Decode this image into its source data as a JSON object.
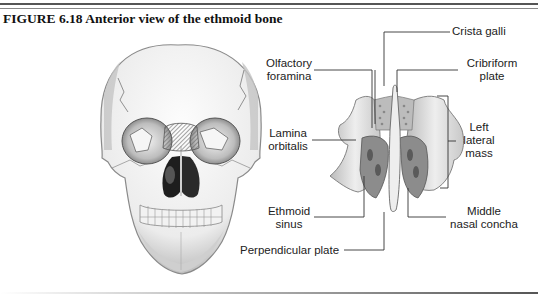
{
  "figure": {
    "title": "FIGURE 6.18  Anterior view of the ethmoid bone"
  },
  "labels": {
    "crista_galli": "Crista galli",
    "olfactory_foramina_1": "Olfactory",
    "olfactory_foramina_2": "foramina",
    "cribriform_plate_1": "Cribriform",
    "cribriform_plate_2": "plate",
    "lamina_orbitalis_1": "Lamina",
    "lamina_orbitalis_2": "orbitalis",
    "left_lateral_mass_1": "Left",
    "left_lateral_mass_2": "lateral",
    "left_lateral_mass_3": "mass",
    "ethmoid_sinus_1": "Ethmoid",
    "ethmoid_sinus_2": "sinus",
    "middle_nasal_concha_1": "Middle",
    "middle_nasal_concha_2": "nasal concha",
    "perpendicular_plate": "Perpendicular plate"
  },
  "colors": {
    "text": "#222222",
    "leader_line": "#333333",
    "bone_fill": "#e6e6e6",
    "bone_shadow": "#9a9a9a",
    "highlight_hatch": "#777777"
  }
}
